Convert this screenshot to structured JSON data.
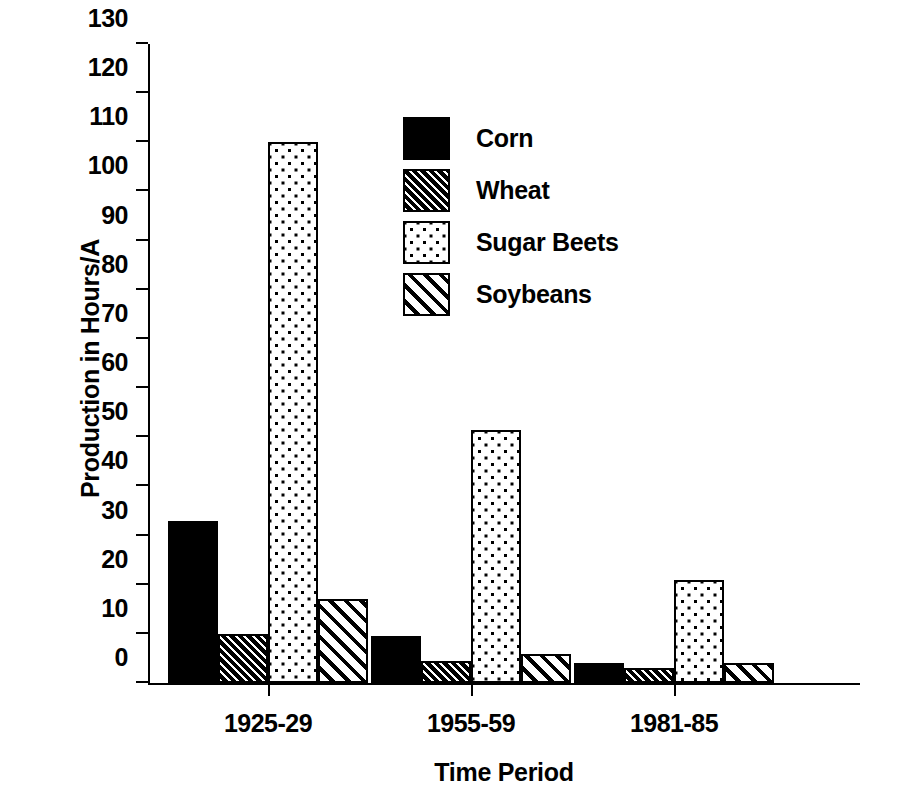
{
  "chart_data": {
    "type": "bar",
    "title": "",
    "xlabel": "Time Period",
    "ylabel": "Production in Hours/A",
    "categories": [
      "1925-29",
      "1955-59",
      "1981-85"
    ],
    "series": [
      {
        "name": "Corn",
        "values": [
          33,
          9.5,
          4
        ],
        "fill": "solid-black"
      },
      {
        "name": "Wheat",
        "values": [
          10,
          4.5,
          3
        ],
        "fill": "dense-diagonal-hatch"
      },
      {
        "name": "Sugar Beets",
        "values": [
          110,
          51.5,
          21
        ],
        "fill": "dotted"
      },
      {
        "name": "Soybeans",
        "values": [
          17,
          6,
          4
        ],
        "fill": "sparse-diagonal-hatch"
      }
    ],
    "ylim": [
      0,
      130
    ],
    "ytick_labels": [
      "0",
      "10",
      "20",
      "30",
      "40",
      "50",
      "60",
      "70",
      "80",
      "90",
      "100",
      "110",
      "120",
      "130"
    ],
    "ytick_values": [
      0,
      10,
      20,
      30,
      40,
      50,
      60,
      70,
      80,
      90,
      100,
      110,
      120,
      130
    ],
    "grid": false,
    "legend_position": "inside-top-center",
    "legend_entries": [
      "Corn",
      "Wheat",
      "Sugar Beets",
      "Soybeans"
    ],
    "colors": {
      "foreground": "#000000",
      "background": "#ffffff"
    }
  }
}
